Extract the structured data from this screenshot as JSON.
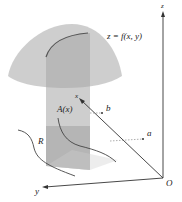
{
  "figure": {
    "type": "3d-volume-by-cross-sections",
    "labels": {
      "surface": "z = f(x, y)",
      "cross_section_area": "A(x)",
      "region": "R",
      "origin": "O",
      "x_axis": "x",
      "y_axis": "y",
      "z_axis": "z",
      "lower_bound": "a",
      "upper_bound": "b"
    },
    "colors": {
      "dome_fill": "#c8c8c8",
      "dome_dark": "#a9a9a9",
      "slice_fill": "#b5b5b5",
      "region_shade": "#bdbdbd",
      "axis": "#333333",
      "curve": "#444444"
    }
  }
}
